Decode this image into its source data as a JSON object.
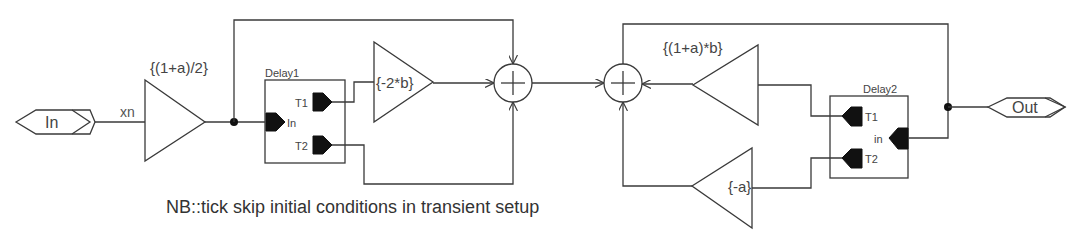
{
  "diagram": {
    "type": "schematic-block-diagram",
    "ports": {
      "input": {
        "label": "In"
      },
      "output": {
        "label": "Out"
      }
    },
    "signals": {
      "input_net": "xn"
    },
    "gains": [
      {
        "id": "gain1",
        "label": "{(1+a)/2}"
      },
      {
        "id": "gain2",
        "label": "{-2*b}"
      },
      {
        "id": "gain3",
        "label": "{(1+a)*b}"
      },
      {
        "id": "gain4",
        "label": "{-a}"
      }
    ],
    "delays": [
      {
        "id": "delay1",
        "title": "Delay1",
        "pins": {
          "in": "In",
          "t1": "T1",
          "t2": "T2"
        }
      },
      {
        "id": "delay2",
        "title": "Delay2",
        "pins": {
          "in": "in",
          "t1": "T1",
          "t2": "T2"
        }
      }
    ],
    "summers": [
      {
        "id": "sum1",
        "symbol": "+"
      },
      {
        "id": "sum2",
        "symbol": "+"
      }
    ],
    "note": "NB::tick skip initial conditions in transient setup",
    "colors": {
      "line": "#3a3a3a",
      "pin": "#111111",
      "background": "#ffffff"
    }
  }
}
